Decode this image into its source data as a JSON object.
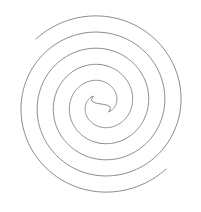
{
  "diagram": {
    "type": "double-spiral",
    "arms": 2,
    "turns_per_arm": 2.5,
    "center_shape": "s-curve",
    "line_color": "#7a7a7a",
    "background": "#ffffff"
  }
}
